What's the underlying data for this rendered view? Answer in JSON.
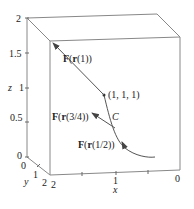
{
  "figure": {
    "axes": {
      "z": {
        "label": "z",
        "ticks": [
          "0",
          "0.5",
          "1",
          "1.5",
          "2"
        ]
      },
      "y": {
        "label": "y",
        "ticks": [
          "0",
          "1",
          "2"
        ]
      },
      "x": {
        "label": "x",
        "ticks": [
          "2",
          "1",
          "0"
        ]
      }
    },
    "point_label": "(1, 1, 1)",
    "curve_label": "C",
    "vectors": [
      {
        "label_bold": "F",
        "label_mid": "(",
        "label_r": "r",
        "label_arg": "(1))",
        "id": "F_r1"
      },
      {
        "label_bold": "F",
        "label_mid": "(",
        "label_r": "r",
        "label_arg": "(3/4))",
        "id": "F_r34"
      },
      {
        "label_bold": "F",
        "label_mid": "(",
        "label_r": "r",
        "label_arg": "(1/2))",
        "id": "F_r12"
      }
    ],
    "colors": {
      "line": "#555555",
      "box": "#888888",
      "text": "#222222"
    }
  }
}
